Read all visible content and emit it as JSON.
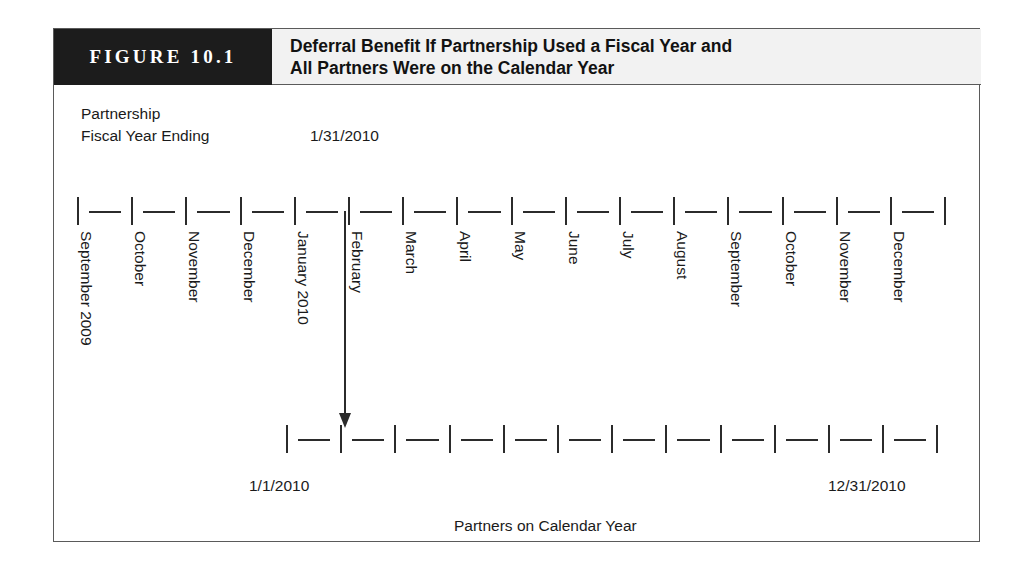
{
  "figure": {
    "number_label": "FIGURE 10.1",
    "title_line_1": "Deferral Benefit If Partnership Used a Fiscal Year and",
    "title_line_2": "All Partners Were on the Calendar Year"
  },
  "captions": {
    "partnership": "Partnership",
    "fiscal_year_ending": "Fiscal Year Ending",
    "partners_on_calendar_year": "Partners on Calendar Year"
  },
  "dates": {
    "fiscal_year_end": "1/31/2010",
    "calendar_start": "1/1/2010",
    "calendar_end": "12/31/2010"
  },
  "chart_data": {
    "type": "timeline",
    "title": "Deferral Benefit If Partnership Used a Fiscal Year and All Partners Were on the Calendar Year",
    "series": [
      {
        "name": "Partnership Fiscal Year Ending",
        "tick_count": 17,
        "segment_count": 16,
        "start_px": 23,
        "spacing_px": 54.2,
        "labels": [
          "September 2009",
          "October",
          "November",
          "December",
          "January 2010",
          "February",
          "March",
          "April",
          "May",
          "June",
          "July",
          "August",
          "September",
          "October",
          "November",
          "December"
        ],
        "annotation": "1/31/2010",
        "annotation_at_tick": 5
      },
      {
        "name": "Partners on Calendar Year",
        "tick_count": 13,
        "segment_count": 12,
        "start_px": 232,
        "spacing_px": 54.2,
        "labels": [],
        "start_label": "1/1/2010",
        "end_label": "12/31/2010"
      }
    ],
    "annotations": [
      {
        "name": "deferral-arrow",
        "from_series": "Partnership Fiscal Year Ending",
        "from_tick": 5,
        "to_series": "Partners on Calendar Year",
        "to_tick": 1,
        "meaning": "11-month deferral period from fiscal year end 1/31/2010 back to calendar year start"
      }
    ],
    "colors": {
      "ink": "#2b2b2b",
      "header_black": "#1c1c1c",
      "header_grey": "#f2f2f2",
      "frame": "#5a5a5a"
    }
  }
}
